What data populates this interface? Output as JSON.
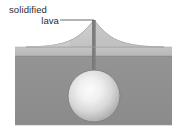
{
  "figure": {
    "kind": "cross-section-diagram",
    "width_px": 184,
    "height_px": 138,
    "background_color": "#ffffff"
  },
  "annotation": {
    "name": "solidified-lava-label",
    "line_1": "solidified",
    "line_2": "lava",
    "text_color": "#2b2b2b",
    "leader_line": {
      "name": "leader-line",
      "color": "#555555",
      "from_x": 60,
      "from_y": 20,
      "to_x": 94,
      "to_y": 20
    }
  },
  "parts": {
    "cone": {
      "name": "solidified-lava-cone",
      "fill": "#c8c8c8",
      "stroke": "#9a9a9a",
      "peak_x": 94,
      "peak_y": 20,
      "base_y": 47,
      "left_base_x": 26,
      "right_base_x": 164
    },
    "upper_layer": {
      "name": "upper-ground-layer",
      "fill": "#bdbdbd",
      "top_y": 47,
      "bottom_y": 56,
      "left_x": 15,
      "right_x": 172
    },
    "lower_layer": {
      "name": "lower-ground-layer",
      "fill": "#8e8e8e",
      "top_y": 56,
      "bottom_y": 125,
      "left_x": 15,
      "right_x": 172
    },
    "conduit": {
      "name": "volcanic-conduit",
      "fill": "#7d7d7d",
      "top_y": 20,
      "bottom_y": 96,
      "x": 94,
      "width": 3.4
    },
    "magma_chamber": {
      "name": "magma-chamber",
      "center_x": 94,
      "center_y": 96,
      "radius": 26,
      "highlight_color": "#f2f2f2",
      "edge_color": "#a6a6a6",
      "outline_color": "#7a7a7a"
    }
  }
}
